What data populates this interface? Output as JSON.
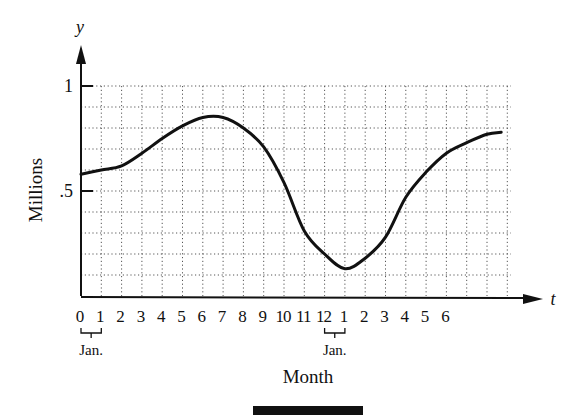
{
  "chart_data": {
    "type": "line",
    "title": "",
    "xlabel": "Month",
    "ylabel": "Millions",
    "x_axis_symbol": "t",
    "y_axis_symbol": "y",
    "xlim": [
      0,
      21
    ],
    "ylim": [
      0,
      1
    ],
    "grid": true,
    "grid_style": "dotted",
    "y_ticks": [
      {
        "value": 1,
        "label": "1"
      },
      {
        "value": 0.5,
        "label": ".5"
      }
    ],
    "x_tick_labels": [
      "0",
      "1",
      "2",
      "3",
      "4",
      "5",
      "6",
      "7",
      "8",
      "9",
      "10",
      "11",
      "12",
      "1",
      "2",
      "3",
      "4",
      "5",
      "6"
    ],
    "annotations": [
      {
        "text": "Jan.",
        "from_t": 0,
        "to_t": 1
      },
      {
        "text": "Jan.",
        "from_t": 12,
        "to_t": 13
      }
    ],
    "legend": null,
    "series": [
      {
        "name": "Millions",
        "x": [
          0,
          1,
          2,
          3,
          4,
          5,
          6,
          7,
          8,
          9,
          10,
          11,
          12,
          13,
          14,
          15,
          16,
          17,
          18,
          19,
          20,
          20.7
        ],
        "values": [
          0.58,
          0.6,
          0.62,
          0.68,
          0.75,
          0.81,
          0.85,
          0.85,
          0.8,
          0.71,
          0.54,
          0.31,
          0.2,
          0.13,
          0.18,
          0.28,
          0.47,
          0.59,
          0.68,
          0.73,
          0.77,
          0.78
        ]
      }
    ]
  },
  "colors": {
    "ink": "#111111",
    "grid": "#555555",
    "background": "#ffffff"
  }
}
